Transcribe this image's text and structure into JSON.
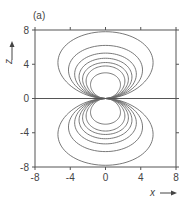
{
  "panel_label": "(a)",
  "chart_data": {
    "type": "line",
    "title": "",
    "panel": "(a)",
    "xlabel": "x",
    "ylabel": "z",
    "xlim": [
      -8,
      8
    ],
    "ylim": [
      -8,
      8
    ],
    "xticks": [
      -8,
      -4,
      0,
      4,
      8
    ],
    "yticks": [
      -8,
      -4,
      0,
      4,
      8
    ],
    "xtick_labels": [
      "-8",
      "-4",
      "0",
      "4",
      "8"
    ],
    "ytick_labels": [
      "-8",
      "-4",
      "0",
      "4",
      "8"
    ],
    "grid": false,
    "legend": null,
    "horizontal_line_at_z": 0,
    "contours": [
      {
        "half_width": 5.4,
        "height": 7.8
      },
      {
        "half_width": 4.2,
        "height": 6.2
      },
      {
        "half_width": 3.5,
        "height": 5.3
      },
      {
        "half_width": 3.0,
        "height": 4.7
      },
      {
        "half_width": 2.6,
        "height": 4.2
      },
      {
        "half_width": 2.2,
        "height": 3.8
      },
      {
        "half_width": 1.7,
        "height": 3.0
      }
    ],
    "line_color": "#6a6a6a",
    "axis_color": "#555555"
  },
  "layout": {
    "plot_left": 35,
    "plot_right": 176,
    "plot_top": 30,
    "plot_bottom": 167
  }
}
